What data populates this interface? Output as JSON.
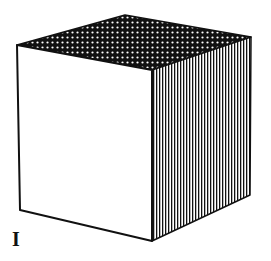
{
  "figure": {
    "label": "I",
    "shape": "cube",
    "faces": {
      "top": {
        "pattern": "white-dots-on-black",
        "fill": "#111111",
        "dot": "#ffffff"
      },
      "front": {
        "pattern": "blank",
        "fill": "#ffffff"
      },
      "right": {
        "pattern": "vertical-stripes",
        "stroke": "#111111"
      }
    },
    "colors": {
      "ink": "#111111",
      "paper": "#ffffff"
    }
  }
}
